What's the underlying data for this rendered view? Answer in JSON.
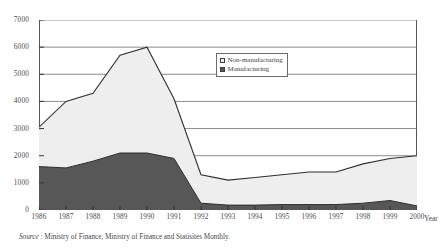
{
  "chart_data": {
    "type": "area",
    "title": "",
    "subtitle": "",
    "xlabel": "Year",
    "ylabel": "",
    "xlim": [
      1986,
      2000
    ],
    "ylim": [
      0,
      7000
    ],
    "grid": true,
    "stacked": true,
    "legend_position": "inside-top-right",
    "categories": [
      "1986",
      "1987",
      "1988",
      "1989",
      "1990",
      "1991",
      "1992",
      "1993",
      "1994",
      "1995",
      "1996",
      "1997",
      "1998",
      "1999",
      "2000"
    ],
    "x": [
      1986,
      1987,
      1988,
      1989,
      1990,
      1991,
      1992,
      1993,
      1994,
      1995,
      1996,
      1997,
      1998,
      1999,
      2000
    ],
    "ytick_labels": [
      "7000",
      "6000",
      "5000",
      "4000",
      "3000",
      "2000",
      "1000",
      "0"
    ],
    "ytick_values": [
      7000,
      6000,
      5000,
      4000,
      3000,
      2000,
      1000,
      0
    ],
    "series": [
      {
        "name": "Manufacturing",
        "color": "#575757",
        "values": [
          1600,
          1550,
          1800,
          2100,
          2100,
          1900,
          250,
          180,
          180,
          200,
          200,
          200,
          250,
          350,
          150
        ]
      },
      {
        "name": "Non-manufacturing",
        "color": "#eeeeee",
        "values": [
          1450,
          2450,
          2500,
          3600,
          3900,
          2200,
          1050,
          920,
          1020,
          1100,
          1200,
          1200,
          1450,
          1550,
          1850
        ]
      }
    ],
    "totals": [
      3050,
      4000,
      4300,
      5700,
      6000,
      4100,
      1300,
      1100,
      1200,
      1300,
      1400,
      1400,
      1700,
      1900,
      2000
    ],
    "annotations": []
  },
  "legend": {
    "items": [
      {
        "label": "Non-manufacturing",
        "swatch": "light-square-icon"
      },
      {
        "label": "Manufacturing",
        "swatch": "dark-square-icon"
      }
    ]
  },
  "axis": {
    "x_title": "Year"
  },
  "source": {
    "label": "Source",
    "text": " : Ministry of Finance, Ministry of Finance and Statisites Monthly."
  }
}
